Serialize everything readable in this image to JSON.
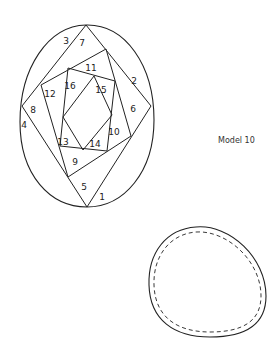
{
  "caption": "Model 10",
  "pattern": {
    "segment_labels": [
      {
        "text": "1",
        "x": 102,
        "y": 200
      },
      {
        "text": "2",
        "x": 134,
        "y": 84
      },
      {
        "text": "3",
        "x": 66,
        "y": 44
      },
      {
        "text": "4",
        "x": 24,
        "y": 128
      },
      {
        "text": "5",
        "x": 84,
        "y": 190
      },
      {
        "text": "6",
        "x": 133,
        "y": 112
      },
      {
        "text": "7",
        "x": 82,
        "y": 46
      },
      {
        "text": "8",
        "x": 33,
        "y": 113
      },
      {
        "text": "9",
        "x": 75,
        "y": 165
      },
      {
        "text": "10",
        "x": 114,
        "y": 135
      },
      {
        "text": "11",
        "x": 91,
        "y": 71
      },
      {
        "text": "12",
        "x": 50,
        "y": 97
      },
      {
        "text": "13",
        "x": 63,
        "y": 145
      },
      {
        "text": "14",
        "x": 95,
        "y": 147
      },
      {
        "text": "15",
        "x": 101,
        "y": 93
      },
      {
        "text": "16",
        "x": 70,
        "y": 89
      }
    ]
  },
  "template": {
    "shape": "egg",
    "outline": "solid",
    "fold_line": "dashed"
  }
}
